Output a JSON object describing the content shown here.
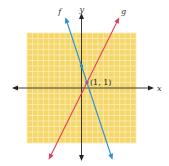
{
  "chart_data": {
    "type": "line",
    "title": "",
    "xlabel": "x",
    "ylabel": "y",
    "xlim": [
      -10,
      10
    ],
    "ylim": [
      -10,
      10
    ],
    "grid": true,
    "series": [
      {
        "name": "f",
        "slope": -3,
        "intercept": 4,
        "color": "#2b8fd6",
        "marked_points": [
          [
            0,
            4
          ],
          [
            1,
            1
          ]
        ]
      },
      {
        "name": "g",
        "slope": 2,
        "intercept": -1,
        "color": "#e0405a",
        "marked_points": []
      }
    ],
    "annotations": [
      {
        "text": "(1, 1)",
        "x": 1,
        "y": 1
      }
    ]
  },
  "colors": {
    "grid_bg": "#f5d66b",
    "grid_line": "#fbeeb5",
    "axis": "#222222"
  }
}
